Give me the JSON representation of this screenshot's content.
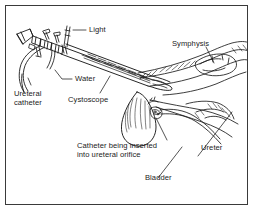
{
  "figure": {
    "border_color": "#3a3a3a",
    "background_color": "#ffffff",
    "ink_color": "#1b1b1b",
    "width": 254,
    "height": 211
  },
  "labels": {
    "light": "Light",
    "symphysis": "Symphysis",
    "water": "Water",
    "ureteral_catheter_line1": "Ureteral",
    "ureteral_catheter_line2": "catheter",
    "cystoscope": "Cystoscope",
    "catheter_inserted_line1": "Catheter being inserted",
    "catheter_inserted_line2": "into ureteral orifice",
    "ureter": "Ureter",
    "bladder": "Bladder"
  }
}
